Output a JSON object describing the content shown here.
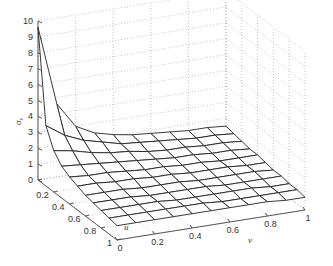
{
  "chart_data": {
    "type": "surface",
    "title": "",
    "xlabel": "u",
    "ylabel": "v",
    "zlabel": "σ_s",
    "xlim": [
      0,
      1
    ],
    "ylim": [
      0,
      1
    ],
    "zlim": [
      0,
      10
    ],
    "grid": true,
    "x_ticks": [
      "0",
      "0.2",
      "0.4",
      "0.6",
      "0.8",
      "1"
    ],
    "y_ticks": [
      "0",
      "0.2",
      "0.4",
      "0.6",
      "0.8",
      "1"
    ],
    "z_ticks": [
      "0",
      "1",
      "2",
      "3",
      "4",
      "5",
      "6",
      "7",
      "8",
      "9",
      "10"
    ],
    "u": [
      0,
      0.1,
      0.2,
      0.3,
      0.4,
      0.5,
      0.6,
      0.7,
      0.8,
      0.9,
      1.0
    ],
    "v": [
      0,
      0.1,
      0.2,
      0.3,
      0.4,
      0.5,
      0.6,
      0.7,
      0.8,
      0.9,
      1.0
    ],
    "z": [
      [
        9.6,
        4.6,
        3.0,
        2.4,
        2.1,
        1.9,
        1.8,
        1.7,
        1.6,
        1.6,
        1.5
      ],
      [
        3.8,
        3.0,
        2.5,
        2.2,
        1.9,
        1.8,
        1.7,
        1.6,
        1.5,
        1.5,
        1.4
      ],
      [
        2.6,
        2.4,
        2.1,
        1.9,
        1.8,
        1.6,
        1.5,
        1.5,
        1.4,
        1.4,
        1.3
      ],
      [
        2.0,
        1.9,
        1.8,
        1.7,
        1.6,
        1.5,
        1.4,
        1.4,
        1.3,
        1.3,
        1.2
      ],
      [
        1.7,
        1.6,
        1.6,
        1.5,
        1.4,
        1.4,
        1.3,
        1.3,
        1.2,
        1.2,
        1.2
      ],
      [
        1.5,
        1.5,
        1.4,
        1.4,
        1.3,
        1.3,
        1.2,
        1.2,
        1.2,
        1.1,
        1.1
      ],
      [
        1.3,
        1.3,
        1.3,
        1.2,
        1.2,
        1.2,
        1.1,
        1.1,
        1.1,
        1.1,
        1.0
      ],
      [
        1.2,
        1.2,
        1.2,
        1.1,
        1.1,
        1.1,
        1.1,
        1.0,
        1.0,
        1.0,
        1.0
      ],
      [
        1.1,
        1.1,
        1.1,
        1.1,
        1.0,
        1.0,
        1.0,
        1.0,
        1.0,
        0.9,
        0.9
      ],
      [
        1.0,
        1.0,
        1.0,
        1.0,
        1.0,
        1.0,
        0.9,
        0.9,
        0.9,
        0.9,
        0.9
      ],
      [
        0.9,
        0.9,
        0.9,
        0.9,
        0.9,
        0.9,
        0.9,
        0.9,
        0.9,
        0.8,
        0.8
      ]
    ],
    "colors": {
      "mesh_edge": "#222222",
      "mesh_face": "#ffffff",
      "grid": "#9a9a9a",
      "axis": "#444444"
    }
  },
  "axes": {
    "u_label": "u",
    "v_label": "v",
    "z_label_main": "σ",
    "z_label_sub": "s"
  }
}
